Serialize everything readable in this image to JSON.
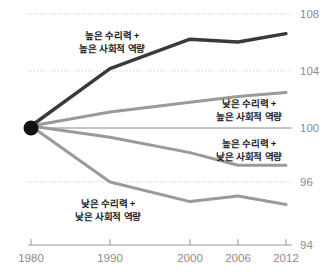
{
  "chart_data": {
    "type": "line",
    "title": "",
    "subtitle": "",
    "xlabel": "",
    "ylabel": "",
    "x": [
      1980,
      1990,
      2000,
      2006,
      2012
    ],
    "xticklabels": [
      "1980",
      "1990",
      "2000",
      "2006",
      "2012"
    ],
    "yticklabels": [
      "108",
      "104",
      "100",
      "96",
      "94"
    ],
    "ytickvalues": [
      108,
      104,
      100,
      96,
      94
    ],
    "ylim": [
      94,
      108.8
    ],
    "xlim": [
      1980,
      2012
    ],
    "grid": "horizontal-dotted",
    "legend": "inline-annotations",
    "baseline_value": 100,
    "origin_marker": {
      "x": 1980,
      "y": 100,
      "style": "filled-circle"
    },
    "series": [
      {
        "name": "높은 수리력 + 높은 사회적 역량",
        "color": "#3a3a3a",
        "values": [
          100,
          104.1,
          106.2,
          106.0,
          106.6
        ]
      },
      {
        "name": "낮은 수리력 + 높은 사회적 역량",
        "color": "#9a9a9a",
        "values": [
          100,
          101.0,
          101.7,
          102.1,
          102.4
        ]
      },
      {
        "name": "높은 수리력 + 낮은 사회적 역량",
        "color": "#9a9a9a",
        "values": [
          100,
          99.2,
          98.1,
          97.2,
          97.2
        ]
      },
      {
        "name": "낮은 수리력 + 낮은 사회적 역량",
        "color": "#9a9a9a",
        "values": [
          100,
          96.0,
          94.6,
          95.0,
          94.4
        ]
      }
    ]
  },
  "annotations": [
    {
      "id": "anno-high-num-high-social",
      "line1": "높은 수리력 +",
      "line2": "높은 사회적 역량"
    },
    {
      "id": "anno-low-num-high-social",
      "line1": "낮은 수리력 +",
      "line2": "높은 사회적 역량"
    },
    {
      "id": "anno-high-num-low-social",
      "line1": "높은 수리력 +",
      "line2": "낮은 사회적 역량"
    },
    {
      "id": "anno-low-num-low-social",
      "line1": "낮은 수리력 +",
      "line2": "낮은 사회적 역량"
    }
  ],
  "axis": {
    "y_ticks": [
      "108",
      "104",
      "100",
      "96",
      "94"
    ],
    "x_ticks": [
      "1980",
      "1990",
      "2000",
      "2006",
      "2012"
    ]
  },
  "colors": {
    "dark_series": "#3a3a3a",
    "gray_series": "#9a9a9a",
    "gridline": "#c9c9c9",
    "baseline": "#7d7d7d",
    "axis_text": "#8c8c8c",
    "background": "#ffffff"
  }
}
